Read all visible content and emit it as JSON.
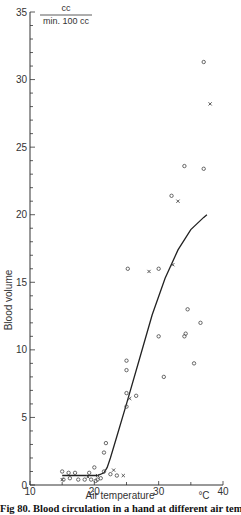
{
  "chart_data": {
    "type": "scatter",
    "title": "",
    "ylabel": "Blood volume",
    "xlabel": "Air temperature",
    "x_unit": "°C",
    "y_unit": {
      "numerator": "cc",
      "denominator": "min. 100 cc"
    },
    "xlim": [
      10,
      40
    ],
    "ylim": [
      0,
      35
    ],
    "x_ticks": [
      10,
      20,
      30,
      40
    ],
    "y_ticks": [
      0,
      5,
      10,
      15,
      20,
      25,
      30,
      35
    ],
    "x_minor_step": 5,
    "y_minor_step": 1,
    "grid": false,
    "legend": null,
    "series": [
      {
        "name": "circles",
        "marker": "o",
        "points": [
          [
            15,
            1.0
          ],
          [
            15.2,
            0.4
          ],
          [
            16,
            0.9
          ],
          [
            16.2,
            0.5
          ],
          [
            17,
            0.9
          ],
          [
            17.5,
            0.4
          ],
          [
            18.5,
            0.4
          ],
          [
            19.2,
            0.9
          ],
          [
            19.5,
            0.4
          ],
          [
            20,
            1.3
          ],
          [
            20.2,
            0.3
          ],
          [
            20.5,
            0.4
          ],
          [
            21,
            0.5
          ],
          [
            21.5,
            1.0
          ],
          [
            21.5,
            2.4
          ],
          [
            21.8,
            3.1
          ],
          [
            22.5,
            0.8
          ],
          [
            23.5,
            0.7
          ],
          [
            25,
            5.8
          ],
          [
            25,
            6.8
          ],
          [
            25,
            8.5
          ],
          [
            25,
            9.2
          ],
          [
            25.2,
            16.0
          ],
          [
            26.5,
            6.6
          ],
          [
            30,
            11.0
          ],
          [
            30,
            16.0
          ],
          [
            30.8,
            8.0
          ],
          [
            32,
            21.4
          ],
          [
            34,
            23.6
          ],
          [
            34,
            11.0
          ],
          [
            34.2,
            11.2
          ],
          [
            34.5,
            13.0
          ],
          [
            35.5,
            9.0
          ],
          [
            36.5,
            12.0
          ],
          [
            37,
            23.4
          ],
          [
            37,
            31.3
          ]
        ]
      },
      {
        "name": "crosses",
        "marker": "x",
        "points": [
          [
            15,
            0.4
          ],
          [
            19,
            0.6
          ],
          [
            20.5,
            0.7
          ],
          [
            23,
            1.1
          ],
          [
            24.5,
            0.7
          ],
          [
            25.5,
            6.4
          ],
          [
            28.5,
            15.8
          ],
          [
            32.2,
            16.3
          ],
          [
            33,
            21.0
          ],
          [
            38,
            28.2
          ]
        ]
      }
    ],
    "fit_curve": {
      "name": "mean curve",
      "points": [
        [
          15,
          0.7
        ],
        [
          17,
          0.7
        ],
        [
          19,
          0.7
        ],
        [
          20.5,
          0.7
        ],
        [
          21.5,
          0.9
        ],
        [
          22,
          1.3
        ],
        [
          22.5,
          2.0
        ],
        [
          23.5,
          3.6
        ],
        [
          25,
          6.0
        ],
        [
          27,
          9.3
        ],
        [
          29,
          12.6
        ],
        [
          31,
          15.3
        ],
        [
          33,
          17.4
        ],
        [
          35,
          18.9
        ],
        [
          37,
          19.8
        ],
        [
          37.5,
          20.0
        ]
      ]
    }
  },
  "caption": "Fig 80. Blood circulation in a hand at different air temperatures"
}
